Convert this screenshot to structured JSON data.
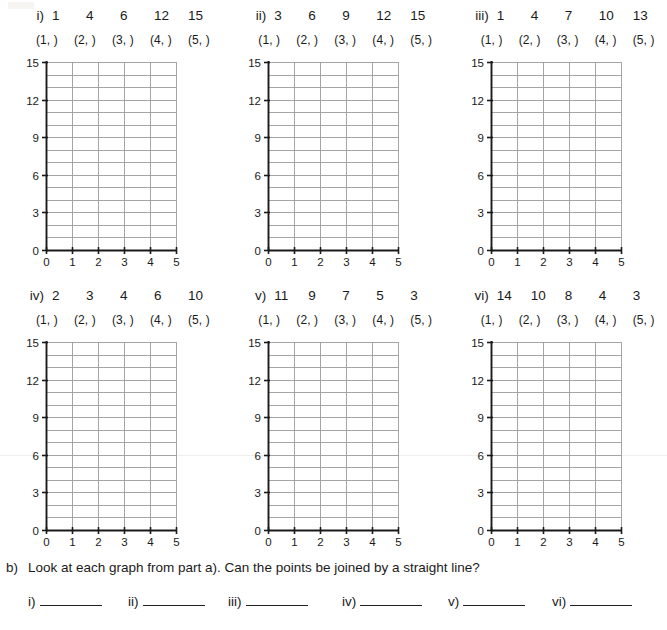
{
  "worksheet": {
    "part_a_problems": [
      {
        "id": "i",
        "label": "i)",
        "numbers": [
          "1",
          "4",
          "6",
          "12",
          "15"
        ],
        "coordinate_blanks": [
          "(1,  )",
          "(2,  )",
          "(3,  )",
          "(4,  )",
          "(5,  )"
        ]
      },
      {
        "id": "ii",
        "label": "ii)",
        "numbers": [
          "3",
          "6",
          "9",
          "12",
          "15"
        ],
        "coordinate_blanks": [
          "(1,  )",
          "(2,  )",
          "(3,  )",
          "(4,  )",
          "(5,  )"
        ]
      },
      {
        "id": "iii",
        "label": "iii)",
        "numbers": [
          "1",
          "4",
          "7",
          "10",
          "13"
        ],
        "coordinate_blanks": [
          "(1,  )",
          "(2,  )",
          "(3,  )",
          "(4,  )",
          "(5,  )"
        ]
      },
      {
        "id": "iv",
        "label": "iv)",
        "numbers": [
          "2",
          "3",
          "4",
          "6",
          "10"
        ],
        "coordinate_blanks": [
          "(1,  )",
          "(2,  )",
          "(3,  )",
          "(4,  )",
          "(5,  )"
        ]
      },
      {
        "id": "v",
        "label": "v)",
        "numbers": [
          "11",
          "9",
          "7",
          "5",
          "3"
        ],
        "coordinate_blanks": [
          "(1,  )",
          "(2,  )",
          "(3,  )",
          "(4,  )",
          "(5,  )"
        ]
      },
      {
        "id": "vi",
        "label": "vi)",
        "numbers": [
          "14",
          "10",
          "8",
          "4",
          "3"
        ],
        "coordinate_blanks": [
          "(1,  )",
          "(2,  )",
          "(3,  )",
          "(4,  )",
          "(5,  )"
        ]
      }
    ],
    "part_b": {
      "label": "b)",
      "question": "Look at each graph from part a). Can the points be joined by a straight line?",
      "answer_items": [
        {
          "label": "i)",
          "value": ""
        },
        {
          "label": "ii)",
          "value": ""
        },
        {
          "label": "iii)",
          "value": ""
        },
        {
          "label": "iv)",
          "value": ""
        },
        {
          "label": "v)",
          "value": ""
        },
        {
          "label": "vi)",
          "value": ""
        }
      ]
    }
  },
  "chart_data": [
    {
      "type": "scatter",
      "title": "i)",
      "series": [
        {
          "name": "i",
          "x": [
            1,
            2,
            3,
            4,
            5
          ],
          "values": [
            1,
            4,
            6,
            12,
            15
          ]
        }
      ],
      "categories": [
        1,
        2,
        3,
        4,
        5
      ],
      "plotted": false,
      "xlabel": "",
      "ylabel": "",
      "xlim": [
        0,
        5
      ],
      "ylim": [
        0,
        15
      ],
      "x_ticks": [
        "0",
        "1",
        "2",
        "3",
        "4",
        "5"
      ],
      "y_ticks": [
        "0",
        "3",
        "6",
        "9",
        "12",
        "15"
      ],
      "y_minor_step": 1,
      "grid": true,
      "legend": "none"
    },
    {
      "type": "scatter",
      "title": "ii)",
      "series": [
        {
          "name": "ii",
          "x": [
            1,
            2,
            3,
            4,
            5
          ],
          "values": [
            3,
            6,
            9,
            12,
            15
          ]
        }
      ],
      "categories": [
        1,
        2,
        3,
        4,
        5
      ],
      "plotted": false,
      "xlabel": "",
      "ylabel": "",
      "xlim": [
        0,
        5
      ],
      "ylim": [
        0,
        15
      ],
      "x_ticks": [
        "0",
        "1",
        "2",
        "3",
        "4",
        "5"
      ],
      "y_ticks": [
        "0",
        "3",
        "6",
        "9",
        "12",
        "15"
      ],
      "y_minor_step": 1,
      "grid": true,
      "legend": "none"
    },
    {
      "type": "scatter",
      "title": "iii)",
      "series": [
        {
          "name": "iii",
          "x": [
            1,
            2,
            3,
            4,
            5
          ],
          "values": [
            1,
            4,
            7,
            10,
            13
          ]
        }
      ],
      "categories": [
        1,
        2,
        3,
        4,
        5
      ],
      "plotted": false,
      "xlabel": "",
      "ylabel": "",
      "xlim": [
        0,
        5
      ],
      "ylim": [
        0,
        15
      ],
      "x_ticks": [
        "0",
        "1",
        "2",
        "3",
        "4",
        "5"
      ],
      "y_ticks": [
        "0",
        "3",
        "6",
        "9",
        "12",
        "15"
      ],
      "y_minor_step": 1,
      "grid": true,
      "legend": "none"
    },
    {
      "type": "scatter",
      "title": "iv)",
      "series": [
        {
          "name": "iv",
          "x": [
            1,
            2,
            3,
            4,
            5
          ],
          "values": [
            2,
            3,
            4,
            6,
            10
          ]
        }
      ],
      "categories": [
        1,
        2,
        3,
        4,
        5
      ],
      "plotted": false,
      "xlabel": "",
      "ylabel": "",
      "xlim": [
        0,
        5
      ],
      "ylim": [
        0,
        15
      ],
      "x_ticks": [
        "0",
        "1",
        "2",
        "3",
        "4",
        "5"
      ],
      "y_ticks": [
        "0",
        "3",
        "6",
        "9",
        "12",
        "15"
      ],
      "y_minor_step": 1,
      "grid": true,
      "legend": "none"
    },
    {
      "type": "scatter",
      "title": "v)",
      "series": [
        {
          "name": "v",
          "x": [
            1,
            2,
            3,
            4,
            5
          ],
          "values": [
            11,
            9,
            7,
            5,
            3
          ]
        }
      ],
      "categories": [
        1,
        2,
        3,
        4,
        5
      ],
      "plotted": false,
      "xlabel": "",
      "ylabel": "",
      "xlim": [
        0,
        5
      ],
      "ylim": [
        0,
        15
      ],
      "x_ticks": [
        "0",
        "1",
        "2",
        "3",
        "4",
        "5"
      ],
      "y_ticks": [
        "0",
        "3",
        "6",
        "9",
        "12",
        "15"
      ],
      "y_minor_step": 1,
      "grid": true,
      "legend": "none"
    },
    {
      "type": "scatter",
      "title": "vi)",
      "series": [
        {
          "name": "vi",
          "x": [
            1,
            2,
            3,
            4,
            5
          ],
          "values": [
            14,
            10,
            8,
            4,
            3
          ]
        }
      ],
      "categories": [
        1,
        2,
        3,
        4,
        5
      ],
      "plotted": false,
      "xlabel": "",
      "ylabel": "",
      "xlim": [
        0,
        5
      ],
      "ylim": [
        0,
        15
      ],
      "x_ticks": [
        "0",
        "1",
        "2",
        "3",
        "4",
        "5"
      ],
      "y_ticks": [
        "0",
        "3",
        "6",
        "9",
        "12",
        "15"
      ],
      "y_minor_step": 1,
      "grid": true,
      "legend": "none"
    }
  ]
}
